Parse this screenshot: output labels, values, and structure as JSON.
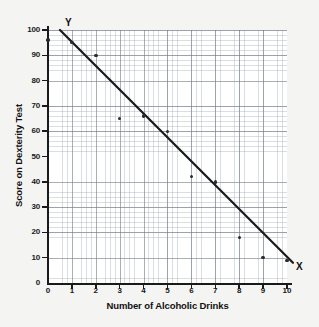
{
  "chart_data": {
    "type": "scatter",
    "title": "",
    "xlabel": "Number of Alcoholic Drinks",
    "ylabel": "Score on Dexterity Test",
    "xlim": [
      0,
      10
    ],
    "ylim": [
      0,
      100
    ],
    "x_ticks": [
      "0",
      "1",
      "2",
      "3",
      "4",
      "5",
      "6",
      "7",
      "8",
      "9",
      "10"
    ],
    "y_ticks": [
      "0",
      "10",
      "20",
      "30",
      "40",
      "50",
      "60",
      "70",
      "80",
      "90",
      "100"
    ],
    "grid": true,
    "legend": "none",
    "x": [
      0,
      1,
      2,
      3,
      4,
      5,
      6,
      7,
      8,
      9,
      10
    ],
    "y": [
      96,
      95,
      90,
      65,
      66,
      60,
      42,
      40,
      18,
      10,
      9
    ],
    "points": [
      {
        "x": 0,
        "y": 96
      },
      {
        "x": 1,
        "y": 95
      },
      {
        "x": 2,
        "y": 90
      },
      {
        "x": 3,
        "y": 65
      },
      {
        "x": 4,
        "y": 66
      },
      {
        "x": 5,
        "y": 60
      },
      {
        "x": 6,
        "y": 42
      },
      {
        "x": 7,
        "y": 40
      },
      {
        "x": 8,
        "y": 18
      },
      {
        "x": 9,
        "y": 10
      },
      {
        "x": 10,
        "y": 9
      }
    ],
    "trend_line": {
      "label": "best-fit line",
      "x0": 0.5,
      "y0": 100,
      "x1": 10.25,
      "y1": 8,
      "color": "#1a1a1a"
    },
    "annotations": [
      {
        "name": "Y",
        "text": "Y",
        "position": "top-of-line"
      },
      {
        "name": "X",
        "text": "X",
        "position": "bottom-right-of-line"
      }
    ],
    "colors": {
      "point": "#2b2b2b",
      "line": "#1a1a1a",
      "axis": "#1a1a1a",
      "grid_minor": "#969ea8",
      "grid_major": "#767e8a",
      "plot_background": "#ffffff",
      "figure_background": "#f4f4f2"
    }
  }
}
